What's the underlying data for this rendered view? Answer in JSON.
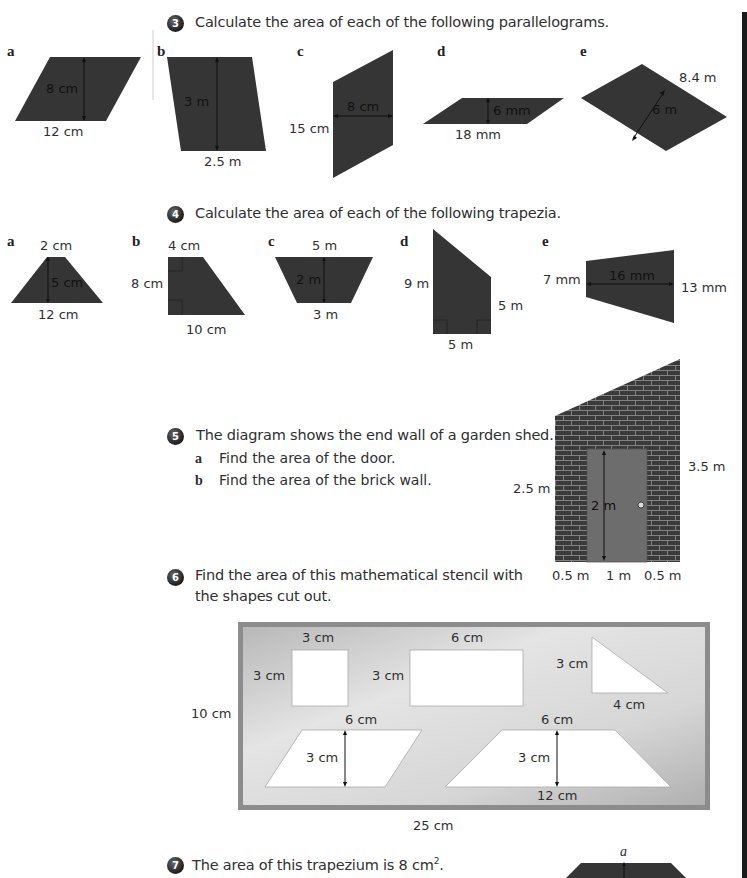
{
  "colors": {
    "shape_fill": "#353535",
    "stencil_bg": "#c9c9c9",
    "door": "#6d6d6d",
    "brick": "#3a3a3a",
    "side_bar": "#1a1a1a"
  },
  "q3": {
    "number": "3",
    "text": "Calculate the area of each of the following parallelograms.",
    "shapes": [
      {
        "letter": "a",
        "base": "12 cm",
        "height": "8 cm"
      },
      {
        "letter": "b",
        "base": "2.5 m",
        "height": "3 m"
      },
      {
        "letter": "c",
        "side": "15 cm",
        "width": "8 cm"
      },
      {
        "letter": "d",
        "base": "18 mm",
        "height": "6 mm"
      },
      {
        "letter": "e",
        "side": "8.4 m",
        "height": "6 m"
      }
    ]
  },
  "q4": {
    "number": "4",
    "text": "Calculate the area of each of the following trapezia.",
    "shapes": [
      {
        "letter": "a",
        "top": "2 cm",
        "bottom": "12 cm",
        "height": "5 cm"
      },
      {
        "letter": "b",
        "top": "4 cm",
        "bottom": "10 cm",
        "height": "8 cm"
      },
      {
        "letter": "c",
        "top": "5 m",
        "bottom": "3 m",
        "height": "2 m"
      },
      {
        "letter": "d",
        "left": "9 m",
        "right": "5 m",
        "bottom": "5 m"
      },
      {
        "letter": "e",
        "left": "7 mm",
        "right": "13 mm",
        "width": "16 mm"
      }
    ]
  },
  "q5": {
    "number": "5",
    "text": "The diagram shows the end wall of a garden shed.",
    "parts": [
      {
        "letter": "a",
        "text": "Find the area of the door."
      },
      {
        "letter": "b",
        "text": "Find the area of the brick wall."
      }
    ],
    "diagram": {
      "left_height": "2.5 m",
      "right_height": "3.5 m",
      "door_height": "2 m",
      "bottom": [
        "0.5 m",
        "1 m",
        "0.5 m"
      ]
    }
  },
  "q6": {
    "number": "6",
    "text_line1": "Find the area of this mathematical stencil with",
    "text_line2": "the shapes cut out.",
    "stencil": {
      "height": "10 cm",
      "width": "25 cm",
      "square": {
        "top": "3 cm",
        "side": "3 cm"
      },
      "rectangle": {
        "top": "6 cm",
        "side": "3 cm"
      },
      "triangle": {
        "side": "3 cm",
        "bottom": "4 cm"
      },
      "parallelogram": {
        "top": "6 cm",
        "height": "3 cm"
      },
      "trapezium": {
        "top": "6 cm",
        "height": "3 cm",
        "bottom": "12 cm"
      }
    }
  },
  "q7": {
    "number": "7",
    "text_before": "The area of this trapezium is 8 cm",
    "sup": "2",
    "text_after": ".",
    "diagram_label": "a"
  }
}
